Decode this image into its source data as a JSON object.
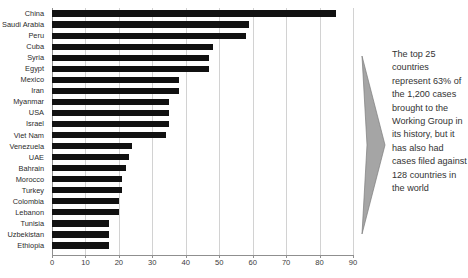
{
  "chart_data": {
    "type": "bar",
    "orientation": "horizontal",
    "title": "",
    "xlabel": "",
    "ylabel": "",
    "xlim": [
      0,
      90
    ],
    "xticks": [
      0,
      10,
      20,
      30,
      40,
      50,
      60,
      70,
      80,
      90
    ],
    "grid": true,
    "legend": false,
    "bar_color": "#111111",
    "categories": [
      "China",
      "Saudi Arabia",
      "Peru",
      "Cuba",
      "Syria",
      "Egypt",
      "Mexico",
      "Iran",
      "Myanmar",
      "USA",
      "Israel",
      "Viet Nam",
      "Venezuela",
      "UAE",
      "Bahrain",
      "Morocco",
      "Turkey",
      "Colombia",
      "Lebanon",
      "Tunisia",
      "Uzbekistan",
      "Ethiopia"
    ],
    "values": [
      85,
      59,
      58,
      48,
      47,
      47,
      38,
      38,
      35,
      35,
      35,
      34,
      24,
      23,
      22,
      21,
      21,
      20,
      20,
      17,
      17,
      17
    ]
  },
  "annotation": {
    "arrow_icon": "right-arrow-triangle",
    "arrow_color": "#9a9a9a",
    "text": "The top 25 countries represent 63% of the 1,200 cases brought to the Working Group in its history, but it has also had cases filed against 128 countries in the world"
  }
}
